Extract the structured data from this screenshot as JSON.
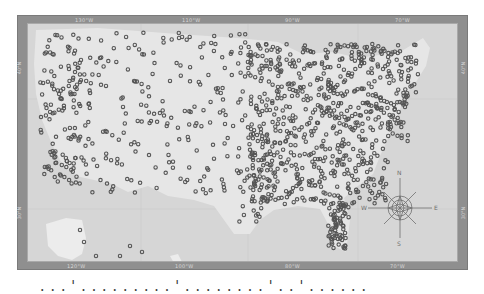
{
  "map": {
    "title": "United States location map",
    "style": "grayscale",
    "colors": {
      "frame": "#8f8f8f",
      "map_background": "#d6d6d6",
      "land": "#e6e6e6",
      "marker": "#555555",
      "compass": "#6e6e6e"
    },
    "top_labels": [
      "130°W",
      "110°W",
      "90°W",
      "70°W"
    ],
    "bottom_labels": [
      "120°W",
      "100°W",
      "80°W",
      "70°W"
    ],
    "left_labels": [
      "40°N",
      "30°N"
    ],
    "right_labels": [
      "40°N",
      "30°N"
    ],
    "compass": {
      "n": "N",
      "s": "S",
      "e": "E",
      "w": "W"
    },
    "marker_type": "circle",
    "marker_density": "dense in eastern US, sparse in west, few in Alaska and Hawaii"
  },
  "caption": {
    "text": "...'.........'........'..'......"
  }
}
